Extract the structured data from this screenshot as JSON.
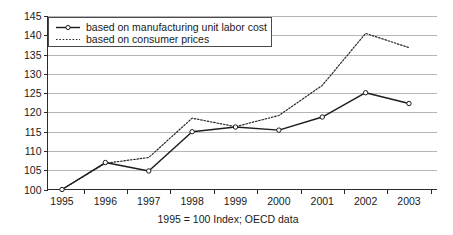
{
  "chart_data": {
    "type": "line",
    "title": "",
    "subtitle": "",
    "caption": "1995 = 100 Index; OECD data",
    "xlabel": "",
    "ylabel": "",
    "categories": [
      "1995",
      "1996",
      "1997",
      "1998",
      "1999",
      "2000",
      "2001",
      "2002",
      "2003"
    ],
    "x_tick_labels": [
      "1995",
      "1996",
      "1997",
      "1998",
      "1999",
      "2000",
      "2001",
      "2002",
      "2003"
    ],
    "y_tick_labels": [
      "100",
      "105",
      "110",
      "115",
      "120",
      "125",
      "130",
      "135",
      "140",
      "145"
    ],
    "y_ticks": [
      100,
      105,
      110,
      115,
      120,
      125,
      130,
      135,
      140,
      145
    ],
    "ylim": [
      100,
      145
    ],
    "grid": true,
    "grid_axis": "y",
    "legend_position": "top-left",
    "series": [
      {
        "name": "based on manufacturing unit labor cost",
        "style": "solid",
        "marker": "open-circle",
        "color": "#1c1c1c",
        "values": [
          100.0,
          107.0,
          104.8,
          115.0,
          116.2,
          115.4,
          118.8,
          125.1,
          122.3
        ]
      },
      {
        "name": "based on consumer prices",
        "style": "dotted",
        "marker": "none",
        "color": "#2a2a2a",
        "values": [
          100.0,
          106.8,
          108.3,
          118.5,
          116.3,
          119.2,
          127.0,
          140.5,
          136.8
        ]
      }
    ]
  },
  "legend": {
    "items": [
      {
        "label": "based on manufacturing unit labor cost"
      },
      {
        "label": "based on consumer prices"
      }
    ]
  },
  "colors": {
    "gridline": "#aeaeae",
    "axis": "#2b2b2b",
    "series_solid": "#1c1c1c",
    "series_dotted": "#2a2a2a",
    "background": "#ffffff"
  }
}
